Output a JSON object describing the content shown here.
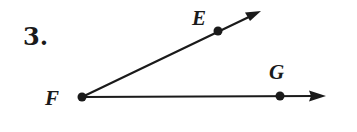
{
  "problem": {
    "number": "3."
  },
  "diagram": {
    "type": "angle",
    "vertex": {
      "label": "F",
      "x": 82,
      "y": 97
    },
    "points": [
      {
        "label": "E",
        "x": 218,
        "y": 31,
        "on_ray": "FE"
      },
      {
        "label": "G",
        "x": 280,
        "y": 96,
        "on_ray": "FG"
      }
    ],
    "rays": [
      {
        "name": "FE",
        "from": "F",
        "through": "E",
        "tip": {
          "x": 261,
          "y": 11
        }
      },
      {
        "name": "FG",
        "from": "F",
        "through": "G",
        "tip": {
          "x": 326,
          "y": 96
        }
      }
    ],
    "colors": {
      "ink": "#1a1a1a",
      "background": "#ffffff"
    }
  }
}
